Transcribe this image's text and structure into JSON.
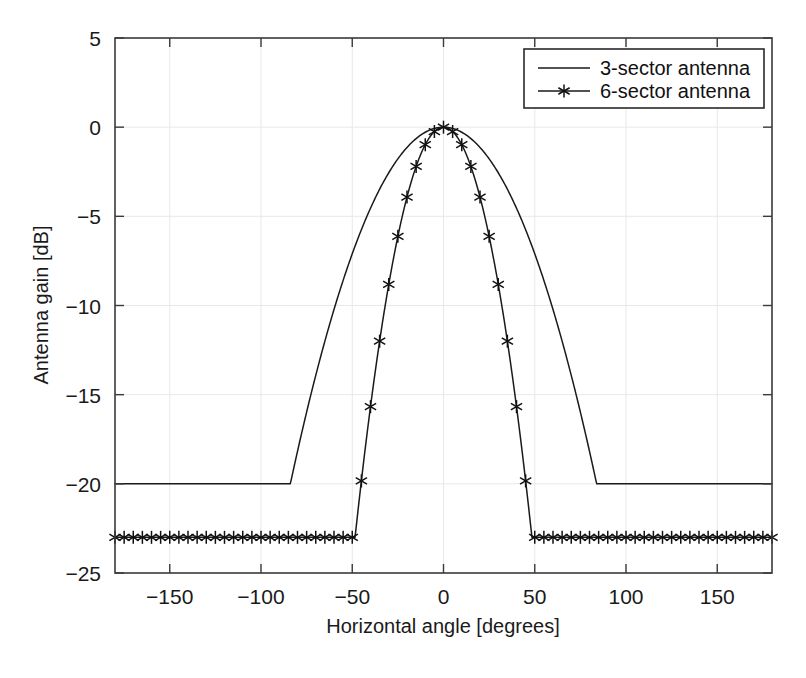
{
  "figure": {
    "background_color": "#ffffff",
    "caption_partial": ""
  },
  "chart_data": {
    "type": "line",
    "title": "",
    "xlabel": "Horizontal angle [degrees]",
    "ylabel": "Antenna gain [dB]",
    "xlim": [
      -180,
      180
    ],
    "ylim": [
      -25,
      5
    ],
    "xticks": [
      -150,
      -100,
      -50,
      0,
      50,
      100,
      150
    ],
    "xtick_labels": [
      "-150",
      "-100",
      "-50",
      "0",
      "50",
      "100",
      "150"
    ],
    "yticks": [
      5,
      0,
      -5,
      -10,
      -15,
      -20,
      -25
    ],
    "ytick_labels": [
      "5",
      "0",
      "-5",
      "-10",
      "-15",
      "-20",
      "-25"
    ],
    "grid": true,
    "legend_position": "upper right",
    "line_color": "#1a1a1a",
    "grid_color": "#e8e8e8",
    "axis_color": "#3a3a3a",
    "series": [
      {
        "name": "3-sector antenna",
        "marker": "none",
        "beamwidth_deg": 65,
        "front_to_back_db": 20,
        "floor_db": -20,
        "peak_db": 0,
        "peak_angle_deg": 0,
        "floor_onset_deg": 87,
        "x": [
          -180,
          -170,
          -160,
          -150,
          -140,
          -130,
          -120,
          -110,
          -100,
          -90,
          -87,
          -85,
          -80,
          -75,
          -70,
          -65,
          -60,
          -55,
          -50,
          -45,
          -40,
          -35,
          -30,
          -25,
          -20,
          -15,
          -10,
          -5,
          0,
          5,
          10,
          15,
          20,
          25,
          30,
          35,
          40,
          45,
          50,
          55,
          60,
          65,
          70,
          75,
          80,
          85,
          87,
          90,
          100,
          110,
          120,
          130,
          140,
          150,
          160,
          170,
          180
        ],
        "y": [
          -20,
          -20,
          -20,
          -20,
          -20,
          -20,
          -20,
          -20,
          -20,
          -20,
          -20,
          -19.2,
          -17.0,
          -15.0,
          -13.2,
          -11.4,
          -9.8,
          -8.2,
          -6.8,
          -5.5,
          -4.4,
          -3.3,
          -2.5,
          -1.7,
          -1.1,
          -0.6,
          -0.3,
          -0.1,
          0,
          -0.1,
          -0.3,
          -0.6,
          -1.1,
          -1.7,
          -2.5,
          -3.3,
          -4.4,
          -5.5,
          -6.8,
          -8.2,
          -9.8,
          -11.4,
          -13.2,
          -15.0,
          -17.0,
          -19.2,
          -20,
          -20,
          -20,
          -20,
          -20,
          -20,
          -20,
          -20,
          -20,
          -20,
          -20
        ]
      },
      {
        "name": "6-sector antenna",
        "marker": "asterisk",
        "marker_interval_deg": 5,
        "beamwidth_deg": 35,
        "front_to_back_db": 23,
        "floor_db": -23,
        "peak_db": 0,
        "peak_angle_deg": 0,
        "floor_onset_deg": 48.5,
        "x": [
          -180,
          -175,
          -170,
          -165,
          -160,
          -155,
          -150,
          -145,
          -140,
          -135,
          -130,
          -125,
          -120,
          -115,
          -110,
          -105,
          -100,
          -95,
          -90,
          -85,
          -80,
          -75,
          -70,
          -65,
          -60,
          -55,
          -50,
          -45,
          -40,
          -35,
          -30,
          -25,
          -20,
          -15,
          -10,
          -5,
          0,
          5,
          10,
          15,
          20,
          25,
          30,
          35,
          40,
          45,
          50,
          55,
          60,
          65,
          70,
          75,
          80,
          85,
          90,
          95,
          100,
          105,
          110,
          115,
          120,
          125,
          130,
          135,
          140,
          145,
          150,
          155,
          160,
          165,
          170,
          175,
          180
        ],
        "y": [
          -23,
          -23,
          -23,
          -23,
          -23,
          -23,
          -23,
          -23,
          -23,
          -23,
          -23,
          -23,
          -23,
          -23,
          -23,
          -23,
          -23,
          -23,
          -23,
          -23,
          -23,
          -23,
          -23,
          -23,
          -23,
          -23,
          -23,
          -23,
          -20.0,
          -15.8,
          -12.1,
          -8.9,
          -6.3,
          -4.1,
          -2.3,
          -1.2,
          0,
          -1.2,
          -2.3,
          -4.1,
          -6.3,
          -8.9,
          -12.1,
          -15.8,
          -20.0,
          -23,
          -23,
          -23,
          -23,
          -23,
          -23,
          -23,
          -23,
          -23,
          -23,
          -23,
          -23,
          -23,
          -23,
          -23,
          -23,
          -23,
          -23,
          -23,
          -23,
          -23,
          -23,
          -23,
          -23,
          -23,
          -23,
          -23,
          -23
        ]
      }
    ]
  }
}
